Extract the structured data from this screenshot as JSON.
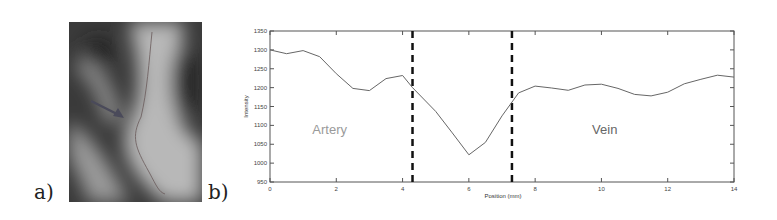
{
  "panels": {
    "a_label": "a)",
    "b_label": "b)"
  },
  "image_a": {
    "description": "grayscale vessel image with profile line and arrow",
    "icons": [
      "arrow-icon"
    ]
  },
  "chart_data": {
    "type": "line",
    "title": "",
    "xlabel": "Position (mm)",
    "ylabel": "Intensity",
    "xlim": [
      0,
      14
    ],
    "ylim": [
      950,
      1350
    ],
    "xticks": [
      0,
      2,
      4,
      6,
      8,
      10,
      12,
      14
    ],
    "yticks": [
      950,
      1000,
      1050,
      1100,
      1150,
      1200,
      1250,
      1300,
      1350
    ],
    "grid": false,
    "legend": null,
    "series": [
      {
        "name": "Intensity profile",
        "x": [
          0,
          0.5,
          1,
          1.5,
          2,
          2.5,
          3,
          3.5,
          4,
          4.3,
          5,
          5.5,
          6,
          6.5,
          7,
          7.5,
          8,
          8.5,
          9,
          9.5,
          10,
          10.5,
          11,
          11.5,
          12,
          12.5,
          13,
          13.5,
          14
        ],
        "values": [
          1300,
          1290,
          1298,
          1282,
          1237,
          1198,
          1192,
          1224,
          1232,
          1200,
          1137,
          1080,
          1022,
          1055,
          1125,
          1186,
          1204,
          1199,
          1193,
          1207,
          1209,
          1198,
          1182,
          1178,
          1188,
          1210,
          1222,
          1233,
          1228
        ]
      }
    ],
    "vlines": [
      {
        "x": 4.3,
        "style": "dashed",
        "color": "#111111"
      },
      {
        "x": 7.3,
        "style": "dashed",
        "color": "#111111"
      }
    ],
    "annotations": [
      {
        "text": "Artery",
        "x": 1.8,
        "y": 1090,
        "color": "#9a9a9a"
      },
      {
        "text": "Vein",
        "x": 10.1,
        "y": 1090,
        "color": "#666666"
      }
    ]
  }
}
